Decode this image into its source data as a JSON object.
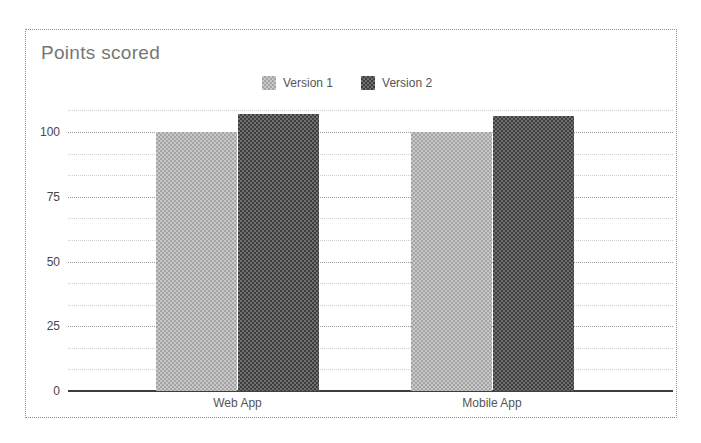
{
  "chart": {
    "title": "Points scored",
    "title_color": "#767676",
    "border_color": "#8f8f8f",
    "background": "#ffffff",
    "axis_color": "#3f3f3f",
    "major_gridline_color": "#9a9a9a",
    "minor_gridline_color": "#cfcfcf"
  },
  "chart_data": {
    "type": "bar",
    "title": "Points scored",
    "categories": [
      "Web App",
      "Mobile App"
    ],
    "series": [
      {
        "name": "Version 1",
        "values": [
          100,
          100
        ],
        "color": "#b5b5b5",
        "checker": [
          "#a4a4a4",
          "#c8c8c8"
        ]
      },
      {
        "name": "Version 2",
        "values": [
          107,
          106
        ],
        "color": "#555555",
        "checker": [
          "#3e3e3e",
          "#707070"
        ]
      }
    ],
    "xlabel": "",
    "ylabel": "",
    "ylim": [
      0,
      108.5
    ],
    "yticks": [
      0,
      25,
      50,
      75,
      100
    ],
    "minor_gridlines_per_interval": 2,
    "grid": true,
    "legend_position": "top-center"
  }
}
